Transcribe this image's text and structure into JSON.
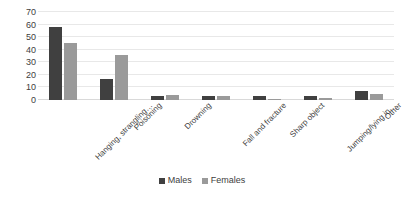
{
  "chart_data": {
    "type": "bar",
    "title": "",
    "xlabel": "",
    "ylabel": "",
    "ylim": [
      0,
      70
    ],
    "yticks": [
      0,
      10,
      20,
      30,
      40,
      50,
      60,
      70
    ],
    "grid": true,
    "legend_position": "bottom",
    "categories": [
      "Hanging, strangling…",
      "Poisoning",
      "Drowning",
      "Fall and fracture",
      "Sharp object",
      "Jumping/lying in…",
      "Other"
    ],
    "series": [
      {
        "name": "Males",
        "color": "#404040",
        "values": [
          58,
          17,
          3,
          3,
          3,
          3,
          7
        ]
      },
      {
        "name": "Females",
        "color": "#9a9a9a",
        "values": [
          45,
          36,
          4,
          3,
          1,
          2,
          5
        ]
      }
    ]
  }
}
